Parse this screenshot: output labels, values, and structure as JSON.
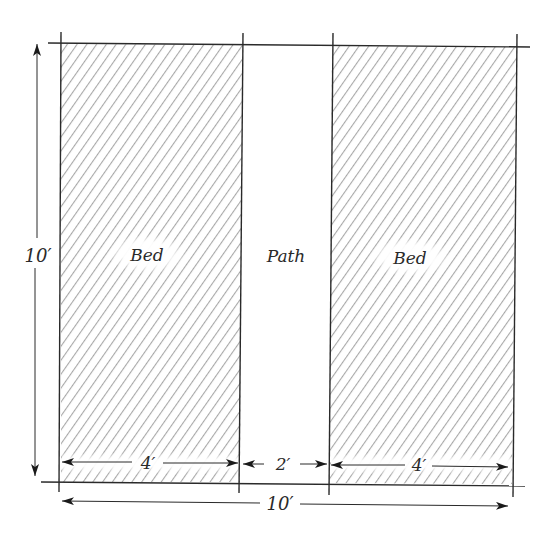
{
  "diagram": {
    "type": "garden-bed-layout",
    "regions": [
      {
        "id": "bed-left",
        "label": "Bed",
        "width_ft": 4,
        "hatched": true
      },
      {
        "id": "path",
        "label": "Path",
        "width_ft": 2,
        "hatched": false
      },
      {
        "id": "bed-right",
        "label": "Bed",
        "width_ft": 4,
        "hatched": true
      }
    ],
    "dimensions": {
      "height_label": "10′",
      "total_width_label": "10′",
      "bed_left_width_label": "4′",
      "path_width_label": "2′",
      "bed_right_width_label": "4′"
    },
    "colors": {
      "line": "#2a2a2a",
      "hatch": "#a8a8a8",
      "background": "#ffffff"
    }
  }
}
